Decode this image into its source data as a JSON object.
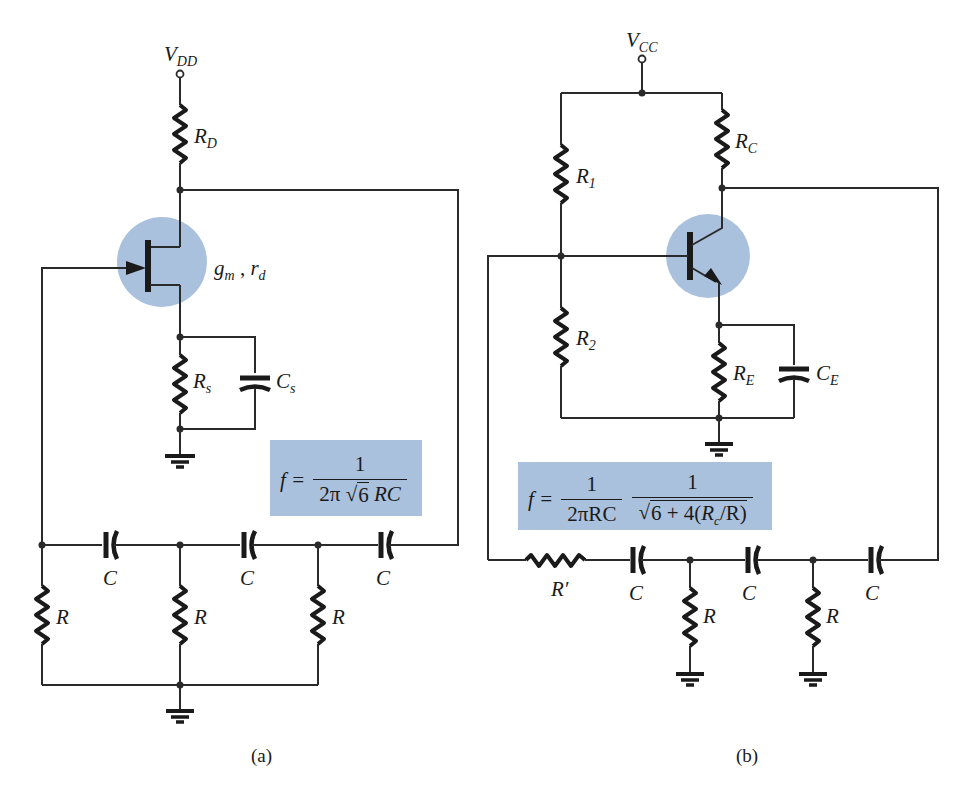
{
  "figure": {
    "caption_a": "(a)",
    "caption_b": "(b)"
  },
  "circuit_a": {
    "title": "FET phase-shift oscillator",
    "supply": {
      "main": "V",
      "sub": "DD"
    },
    "drain_resistor": {
      "main": "R",
      "sub": "D"
    },
    "transistor_params": {
      "g": "g",
      "g_sub": "m",
      "sep": " , ",
      "r": "r",
      "r_sub": "d"
    },
    "source_resistor": {
      "main": "R",
      "sub": "s"
    },
    "source_capacitor": {
      "main": "C",
      "sub": "s"
    },
    "ladder_capacitors": [
      "C",
      "C",
      "C"
    ],
    "ladder_resistors": [
      "R",
      "R",
      "R"
    ],
    "formula": {
      "lhs": "f =",
      "numerator": "1",
      "den_prefix": "2π",
      "den_radicand": "6",
      "den_suffix": "RC"
    }
  },
  "circuit_b": {
    "title": "BJT phase-shift oscillator",
    "supply": {
      "main": "V",
      "sub": "CC"
    },
    "bias_resistor_1": {
      "main": "R",
      "sub": "1"
    },
    "bias_resistor_2": {
      "main": "R",
      "sub": "2"
    },
    "collector_resistor": {
      "main": "R",
      "sub": "C"
    },
    "emitter_resistor": {
      "main": "R",
      "sub": "E"
    },
    "emitter_capacitor": {
      "main": "C",
      "sub": "E"
    },
    "series_resistor": "R′",
    "ladder_capacitors": [
      "C",
      "C",
      "C"
    ],
    "ladder_resistors": [
      "R",
      "R"
    ],
    "formula": {
      "lhs": "f =",
      "num1": "1",
      "den1": "2πRC",
      "num2": "1",
      "den2_pre": "6 + 4(",
      "den2_rc": "R",
      "den2_rc_sub": "c",
      "den2_post": "/R)"
    }
  },
  "colors": {
    "highlight": "#a9c1dd",
    "wire": "#2a2a2a",
    "background": "#ffffff"
  }
}
